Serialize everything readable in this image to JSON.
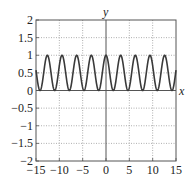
{
  "chart_data": {
    "type": "line",
    "title": "",
    "xlabel": "x",
    "ylabel": "y",
    "xlim": [
      -15,
      15
    ],
    "ylim": [
      -2,
      2
    ],
    "grid": true,
    "legend": null,
    "xticks": [
      -15,
      -10,
      -5,
      0,
      5,
      10,
      15
    ],
    "xtick_labels": [
      "−15",
      "−10",
      "−5",
      "0",
      "5",
      "10",
      "15"
    ],
    "yticks": [
      -2,
      -1.5,
      -1,
      -0.5,
      0,
      0.5,
      1,
      1.5,
      2
    ],
    "ytick_labels": [
      "−2",
      "−1.5",
      "−1",
      "−0.5",
      "0",
      "0.5",
      "1",
      "1.5",
      "2"
    ],
    "series": [
      {
        "name": "y = cos^2(x)",
        "function": "cos(x)^2",
        "color": "#3a3a3a",
        "sample_points": {
          "x": [
            -15,
            -14.137,
            -12.566,
            -10.996,
            -9.425,
            -7.854,
            -6.283,
            -4.712,
            -3.142,
            -1.571,
            0,
            1.571,
            3.142,
            4.712,
            6.283,
            7.854,
            9.425,
            10.996,
            12.566,
            14.137,
            15
          ],
          "y": [
            0.57,
            0,
            1,
            0,
            1,
            0,
            1,
            0,
            1,
            0,
            1,
            0,
            1,
            0,
            1,
            0,
            1,
            0,
            1,
            0,
            0.57
          ]
        }
      }
    ]
  },
  "colors": {
    "curve": "#3a3a3a",
    "axis": "#555555",
    "grid": "#9a9a9a",
    "frame": "#555555"
  }
}
